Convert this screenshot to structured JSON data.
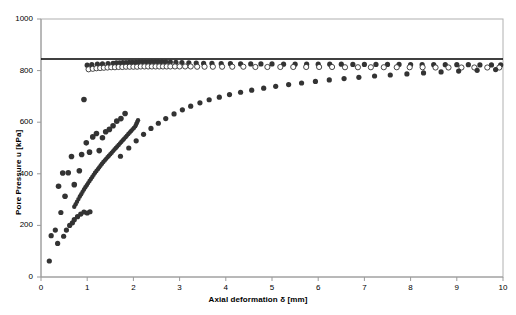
{
  "chart_data": {
    "type": "scatter",
    "title": "",
    "xlabel": "Axial deformation δ [mm]",
    "ylabel": "Pore Pressure u [kPa]",
    "xlim": [
      0,
      10
    ],
    "ylim": [
      0,
      1000
    ],
    "xticks": [
      0,
      1,
      2,
      3,
      4,
      5,
      6,
      7,
      8,
      9,
      10
    ],
    "yticks": [
      0,
      200,
      400,
      600,
      800,
      1000
    ],
    "xtick_labels": [
      "0",
      "1",
      "2",
      "3",
      "4",
      "5",
      "6",
      "7",
      "8",
      "9",
      "10"
    ],
    "ytick_labels": [
      "0",
      "200",
      "400",
      "600",
      "800",
      "1000"
    ],
    "grid": false,
    "legend": "none",
    "plot_border": true,
    "marker_color": "#333333",
    "line_color": "#000000",
    "annotations": [
      {
        "name": "back-pressure-line",
        "type": "hline",
        "y": 845,
        "label": ""
      }
    ],
    "series": [
      {
        "name": "Test A filled plateau",
        "marker": "filled-circle",
        "size": 2.6,
        "points": [
          [
            1.0,
            821
          ],
          [
            1.1,
            823
          ],
          [
            1.22,
            825
          ],
          [
            1.33,
            826
          ],
          [
            1.45,
            827
          ],
          [
            1.56,
            828
          ],
          [
            1.63,
            830
          ],
          [
            1.7,
            830
          ],
          [
            1.77,
            831
          ],
          [
            1.84,
            831
          ],
          [
            1.91,
            832
          ],
          [
            1.98,
            832
          ],
          [
            2.05,
            832
          ],
          [
            2.12,
            833
          ],
          [
            2.19,
            833
          ],
          [
            2.26,
            833
          ],
          [
            2.33,
            833
          ],
          [
            2.4,
            834
          ],
          [
            2.47,
            834
          ],
          [
            2.54,
            834
          ],
          [
            2.62,
            834
          ],
          [
            2.7,
            834
          ],
          [
            2.8,
            833
          ],
          [
            2.92,
            832
          ],
          [
            3.05,
            831
          ],
          [
            3.2,
            830
          ],
          [
            3.36,
            829
          ],
          [
            3.52,
            828
          ],
          [
            3.7,
            828
          ],
          [
            3.9,
            827
          ],
          [
            4.1,
            827
          ],
          [
            4.32,
            826
          ],
          [
            4.54,
            826
          ],
          [
            4.76,
            826
          ],
          [
            5.0,
            826
          ],
          [
            5.25,
            825
          ],
          [
            5.5,
            825
          ],
          [
            5.75,
            825
          ],
          [
            6.0,
            825
          ],
          [
            6.25,
            825
          ],
          [
            6.5,
            825
          ],
          [
            6.75,
            824
          ],
          [
            7.0,
            824
          ],
          [
            7.25,
            824
          ],
          [
            7.5,
            824
          ],
          [
            7.75,
            824
          ],
          [
            8.0,
            823
          ],
          [
            8.25,
            823
          ],
          [
            8.5,
            823
          ],
          [
            8.75,
            823
          ],
          [
            9.0,
            823
          ],
          [
            9.25,
            823
          ],
          [
            9.5,
            822
          ],
          [
            9.75,
            822
          ],
          [
            9.95,
            822
          ]
        ]
      },
      {
        "name": "Test B open plateau",
        "marker": "open-circle",
        "size": 2.6,
        "points": [
          [
            1.03,
            805
          ],
          [
            1.12,
            807
          ],
          [
            1.2,
            809
          ],
          [
            1.28,
            810
          ],
          [
            1.36,
            811
          ],
          [
            1.44,
            812
          ],
          [
            1.52,
            813
          ],
          [
            1.6,
            813
          ],
          [
            1.68,
            814
          ],
          [
            1.76,
            814
          ],
          [
            1.84,
            815
          ],
          [
            1.92,
            815
          ],
          [
            2.0,
            815
          ],
          [
            2.08,
            815
          ],
          [
            2.16,
            816
          ],
          [
            2.24,
            816
          ],
          [
            2.32,
            816
          ],
          [
            2.4,
            816
          ],
          [
            2.48,
            816
          ],
          [
            2.56,
            816
          ],
          [
            2.64,
            816
          ],
          [
            2.72,
            816
          ],
          [
            2.8,
            816
          ],
          [
            2.9,
            816
          ],
          [
            3.0,
            816
          ],
          [
            3.12,
            816
          ],
          [
            3.24,
            816
          ],
          [
            3.38,
            815
          ],
          [
            3.54,
            815
          ],
          [
            3.72,
            815
          ],
          [
            3.92,
            815
          ],
          [
            4.14,
            815
          ],
          [
            4.38,
            815
          ],
          [
            4.64,
            814
          ],
          [
            4.9,
            814
          ],
          [
            5.18,
            814
          ],
          [
            5.46,
            814
          ],
          [
            5.74,
            814
          ],
          [
            6.02,
            814
          ],
          [
            6.3,
            814
          ],
          [
            6.58,
            813
          ],
          [
            6.86,
            813
          ],
          [
            7.14,
            813
          ],
          [
            7.42,
            813
          ],
          [
            7.7,
            813
          ],
          [
            7.98,
            813
          ],
          [
            8.26,
            813
          ],
          [
            8.54,
            812
          ],
          [
            8.82,
            812
          ],
          [
            9.1,
            812
          ],
          [
            9.38,
            812
          ],
          [
            9.66,
            812
          ],
          [
            9.92,
            812
          ]
        ]
      },
      {
        "name": "Test C rising curve",
        "marker": "filled-circle",
        "size": 2.6,
        "points": [
          [
            1.72,
            468
          ],
          [
            1.9,
            500
          ],
          [
            2.06,
            528
          ],
          [
            2.22,
            553
          ],
          [
            2.38,
            576
          ],
          [
            2.54,
            596
          ],
          [
            2.7,
            614
          ],
          [
            2.88,
            632
          ],
          [
            3.06,
            648
          ],
          [
            3.24,
            662
          ],
          [
            3.44,
            675
          ],
          [
            3.64,
            687
          ],
          [
            3.86,
            697
          ],
          [
            4.08,
            707
          ],
          [
            4.32,
            716
          ],
          [
            4.56,
            724
          ],
          [
            4.82,
            732
          ],
          [
            5.08,
            739
          ],
          [
            5.36,
            746
          ],
          [
            5.64,
            752
          ],
          [
            5.94,
            758
          ],
          [
            6.24,
            764
          ],
          [
            6.56,
            769
          ],
          [
            6.88,
            774
          ],
          [
            7.22,
            779
          ],
          [
            7.56,
            783
          ],
          [
            7.92,
            787
          ],
          [
            8.28,
            791
          ],
          [
            8.66,
            795
          ],
          [
            9.04,
            798
          ],
          [
            9.44,
            801
          ],
          [
            9.84,
            804
          ]
        ]
      },
      {
        "name": "Test D dense rise",
        "marker": "filled-circle",
        "size": 2.2,
        "points": [
          [
            0.72,
            272
          ],
          [
            0.75,
            282
          ],
          [
            0.78,
            292
          ],
          [
            0.81,
            302
          ],
          [
            0.84,
            312
          ],
          [
            0.87,
            321
          ],
          [
            0.9,
            330
          ],
          [
            0.93,
            339
          ],
          [
            0.96,
            348
          ],
          [
            0.99,
            356
          ],
          [
            1.02,
            364
          ],
          [
            1.05,
            372
          ],
          [
            1.08,
            380
          ],
          [
            1.11,
            388
          ],
          [
            1.14,
            396
          ],
          [
            1.17,
            404
          ],
          [
            1.2,
            411
          ],
          [
            1.23,
            418
          ],
          [
            1.26,
            425
          ],
          [
            1.29,
            432
          ],
          [
            1.32,
            439
          ],
          [
            1.35,
            446
          ],
          [
            1.38,
            452
          ],
          [
            1.41,
            458
          ],
          [
            1.44,
            464
          ],
          [
            1.47,
            470
          ],
          [
            1.5,
            476
          ],
          [
            1.53,
            482
          ],
          [
            1.56,
            488
          ],
          [
            1.59,
            494
          ],
          [
            1.62,
            500
          ],
          [
            1.65,
            506
          ],
          [
            1.68,
            512
          ],
          [
            1.71,
            518
          ],
          [
            1.74,
            524
          ],
          [
            1.77,
            530
          ],
          [
            1.8,
            536
          ],
          [
            1.83,
            542
          ],
          [
            1.86,
            548
          ],
          [
            1.89,
            554
          ],
          [
            1.92,
            560
          ],
          [
            1.95,
            566
          ],
          [
            1.98,
            572
          ],
          [
            2.01,
            578
          ],
          [
            2.04,
            584
          ],
          [
            2.06,
            592
          ],
          [
            2.08,
            600
          ],
          [
            2.1,
            608
          ]
        ]
      },
      {
        "name": "Test E scatter low",
        "marker": "filled-circle",
        "size": 2.6,
        "points": [
          [
            0.18,
            62
          ],
          [
            0.22,
            160
          ],
          [
            0.31,
            182
          ],
          [
            0.36,
            130
          ],
          [
            0.43,
            250
          ],
          [
            0.49,
            158
          ],
          [
            0.55,
            182
          ],
          [
            0.62,
            200
          ],
          [
            0.68,
            210
          ],
          [
            0.72,
            222
          ],
          [
            0.79,
            234
          ],
          [
            0.86,
            244
          ],
          [
            0.93,
            252
          ],
          [
            1.0,
            248
          ],
          [
            1.06,
            253
          ]
        ]
      },
      {
        "name": "Test F scatter mid",
        "marker": "filled-circle",
        "size": 2.8,
        "points": [
          [
            0.38,
            352
          ],
          [
            0.47,
            403
          ],
          [
            0.52,
            313
          ],
          [
            0.59,
            404
          ],
          [
            0.66,
            467
          ],
          [
            0.72,
            358
          ],
          [
            0.83,
            412
          ],
          [
            0.88,
            475
          ],
          [
            0.98,
            520
          ],
          [
            1.05,
            484
          ],
          [
            1.12,
            543
          ],
          [
            1.2,
            556
          ],
          [
            1.26,
            490
          ],
          [
            1.33,
            540
          ],
          [
            1.4,
            563
          ],
          [
            1.48,
            572
          ],
          [
            1.56,
            586
          ],
          [
            1.64,
            604
          ],
          [
            1.73,
            614
          ],
          [
            1.82,
            634
          ],
          [
            0.93,
            688
          ]
        ]
      }
    ]
  },
  "axes": {
    "xlabel": "Axial deformation δ [mm]",
    "ylabel": "Pore Pressure u [kPa]"
  }
}
